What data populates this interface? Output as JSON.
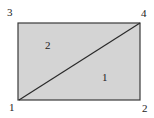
{
  "diagram": {
    "type": "rectangle split by diagonal into two triangles",
    "fill_color": "#d4d4d4",
    "stroke_color": "#333333",
    "nodes": [
      {
        "id": "1",
        "label": "1",
        "position": "bottom-left"
      },
      {
        "id": "2",
        "label": "2",
        "position": "bottom-right"
      },
      {
        "id": "3",
        "label": "3",
        "position": "top-left"
      },
      {
        "id": "4",
        "label": "4",
        "position": "top-right"
      }
    ],
    "edges": [
      [
        "1",
        "2"
      ],
      [
        "2",
        "4"
      ],
      [
        "4",
        "3"
      ],
      [
        "3",
        "1"
      ],
      [
        "1",
        "4"
      ]
    ],
    "regions": [
      {
        "label": "1",
        "vertices": [
          "1",
          "2",
          "4"
        ]
      },
      {
        "label": "2",
        "vertices": [
          "1",
          "4",
          "3"
        ]
      }
    ]
  }
}
